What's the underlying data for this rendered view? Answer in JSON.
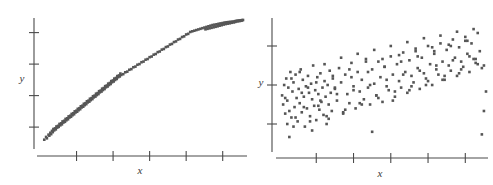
{
  "figure": {
    "name": "correlation-scatterplot-pair",
    "background_color": "#ffffff",
    "point_color": "#565656",
    "axis_color": "#4a4a4a"
  },
  "chart_data": [
    {
      "type": "scatter",
      "panel": "left",
      "title": "",
      "xlabel": "x",
      "ylabel": "y",
      "xlim": [
        0,
        100
      ],
      "ylim": [
        0,
        100
      ],
      "grid": false,
      "legend": null,
      "x_ticks": [
        18,
        36,
        54,
        72,
        90
      ],
      "y_ticks": [
        15,
        40,
        65,
        90
      ],
      "x_tick_labels": [
        "",
        "",
        "",
        "",
        ""
      ],
      "y_tick_labels": [
        "",
        "",
        "",
        ""
      ],
      "description": "Strong positive linear correlation, tight narrow band of points",
      "n_points": 185,
      "x": [
        2.1,
        3.0,
        3.4,
        4.2,
        4.6,
        5.1,
        5.5,
        5.9,
        6.3,
        6.6,
        7.0,
        7.4,
        7.8,
        8.1,
        8.5,
        8.9,
        9.2,
        9.6,
        10.0,
        10.4,
        10.8,
        11.1,
        11.5,
        11.9,
        12.3,
        12.6,
        13.0,
        13.4,
        13.8,
        14.1,
        14.5,
        14.9,
        15.3,
        15.6,
        16.0,
        16.4,
        16.8,
        17.1,
        17.5,
        17.9,
        18.3,
        18.6,
        19.0,
        19.4,
        19.8,
        20.1,
        20.5,
        20.9,
        21.3,
        21.6,
        22.0,
        22.4,
        22.8,
        23.1,
        23.5,
        23.9,
        24.3,
        24.6,
        25.0,
        25.4,
        25.8,
        26.1,
        26.5,
        26.9,
        27.3,
        27.6,
        28.0,
        28.4,
        28.8,
        29.1,
        29.5,
        29.9,
        30.3,
        30.6,
        31.0,
        31.4,
        31.8,
        32.1,
        32.5,
        32.9,
        33.3,
        33.6,
        34.0,
        34.4,
        34.8,
        35.1,
        35.5,
        35.9,
        36.3,
        36.6,
        37.0,
        37.4,
        37.8,
        38.1,
        38.5,
        38.9,
        39.3,
        39.6,
        40.0,
        41.0,
        42.0,
        43.0,
        44.0,
        45.0,
        46.0,
        47.0,
        48.0,
        49.0,
        50.0,
        51.0,
        52.0,
        53.0,
        54.0,
        55.0,
        56.0,
        57.0,
        58.0,
        59.0,
        60.0,
        61.0,
        62.0,
        63.0,
        64.0,
        65.0,
        66.0,
        67.0,
        68.0,
        69.0,
        70.0,
        71.0,
        72.0,
        73.0,
        74.0,
        75.0,
        76.0,
        77.0,
        78.0,
        79.0,
        80.0,
        81.0,
        82.0,
        83.0,
        84.0,
        85.0,
        86.0,
        87.0,
        88.0,
        89.0,
        90.0,
        91.0,
        92.0,
        93.0,
        94.0,
        95.0,
        96.0,
        96.5,
        97.0,
        97.5,
        98.0,
        98.5,
        99.0,
        99.3,
        99.6,
        100.0,
        93.5,
        94.5,
        95.5,
        96.2,
        97.2,
        98.2,
        99.1,
        91.5,
        92.5,
        89.5,
        90.5,
        87.5,
        88.5,
        85.5,
        86.5,
        83.5,
        84.5,
        81.5,
        82.5
      ],
      "y": [
        5.0,
        7.2,
        6.1,
        9.0,
        8.2,
        10.5,
        9.4,
        12.0,
        11.0,
        13.5,
        12.4,
        14.0,
        13.2,
        15.5,
        14.6,
        16.0,
        15.2,
        17.5,
        16.4,
        18.0,
        17.2,
        19.5,
        18.6,
        20.0,
        19.2,
        21.5,
        20.4,
        22.0,
        21.2,
        23.5,
        22.6,
        24.0,
        23.2,
        25.5,
        24.4,
        26.0,
        25.2,
        27.5,
        26.6,
        28.0,
        27.2,
        29.5,
        28.4,
        30.0,
        29.2,
        31.5,
        30.6,
        32.0,
        31.2,
        33.5,
        32.4,
        34.0,
        33.2,
        35.5,
        34.6,
        36.0,
        35.2,
        37.5,
        36.4,
        38.0,
        37.2,
        39.5,
        38.6,
        40.0,
        39.2,
        41.5,
        40.4,
        42.0,
        41.2,
        43.5,
        42.6,
        44.0,
        43.2,
        45.5,
        44.4,
        46.0,
        45.2,
        47.5,
        46.6,
        48.0,
        47.2,
        49.5,
        48.4,
        50.0,
        49.2,
        51.5,
        50.6,
        52.0,
        51.2,
        53.5,
        52.4,
        54.0,
        53.2,
        55.5,
        54.6,
        56.0,
        55.2,
        57.5,
        56.4,
        57.0,
        58.5,
        59.0,
        60.5,
        61.0,
        62.5,
        63.0,
        64.5,
        65.0,
        66.5,
        67.0,
        68.5,
        69.0,
        70.5,
        71.0,
        72.5,
        73.0,
        74.5,
        75.0,
        76.5,
        77.0,
        78.5,
        79.0,
        80.5,
        81.0,
        82.5,
        83.0,
        84.5,
        85.0,
        86.5,
        87.0,
        88.5,
        89.0,
        90.5,
        91.0,
        91.5,
        92.0,
        92.5,
        93.0,
        93.5,
        94.0,
        94.5,
        95.0,
        95.5,
        96.0,
        96.3,
        96.6,
        97.0,
        97.3,
        97.6,
        98.0,
        98.2,
        98.4,
        98.6,
        98.8,
        99.0,
        99.2,
        99.3,
        99.4,
        99.5,
        99.6,
        99.7,
        99.8,
        99.9,
        100.0,
        97.4,
        97.8,
        98.1,
        98.5,
        98.9,
        99.1,
        99.4,
        96.8,
        97.1,
        95.9,
        96.4,
        95.0,
        95.5,
        94.2,
        94.6,
        93.4,
        93.8,
        92.6,
        93.0
      ]
    },
    {
      "type": "scatter",
      "panel": "right",
      "title": "",
      "xlabel": "x",
      "ylabel": "y",
      "xlim": [
        0,
        100
      ],
      "ylim": [
        0,
        100
      ],
      "grid": false,
      "legend": null,
      "x_ticks": [
        18,
        36,
        54,
        72,
        90
      ],
      "y_ticks": [
        20,
        50,
        80
      ],
      "x_tick_labels": [
        "",
        "",
        "",
        "",
        ""
      ],
      "y_tick_labels": [
        "",
        "",
        ""
      ],
      "description": "Moderate positive correlation, widely scattered cloud of points",
      "n_points": 200,
      "x": [
        1.5,
        2.0,
        2.5,
        3.0,
        3.5,
        4.0,
        4.5,
        5.0,
        5.5,
        6.0,
        6.5,
        7.0,
        7.5,
        8.0,
        8.5,
        9.0,
        9.5,
        10.0,
        10.5,
        11.0,
        11.5,
        12.0,
        12.5,
        13.0,
        13.5,
        14.0,
        14.5,
        15.0,
        15.5,
        16.0,
        16.5,
        17.0,
        17.5,
        18.0,
        18.5,
        19.0,
        19.5,
        20.0,
        20.5,
        21.0,
        21.5,
        22.0,
        22.5,
        23.0,
        23.5,
        24.0,
        24.5,
        25.0,
        25.5,
        26.0,
        27.0,
        28.0,
        29.0,
        30.0,
        31.0,
        32.0,
        33.0,
        34.0,
        35.0,
        36.0,
        37.0,
        38.0,
        39.0,
        40.0,
        41.0,
        42.0,
        43.0,
        44.0,
        45.0,
        46.0,
        47.0,
        48.0,
        49.0,
        50.0,
        51.0,
        52.0,
        53.0,
        54.0,
        55.0,
        56.0,
        57.0,
        58.0,
        59.0,
        60.0,
        61.0,
        62.0,
        63.0,
        64.0,
        65.0,
        66.0,
        67.0,
        68.0,
        69.0,
        70.0,
        71.0,
        72.0,
        73.0,
        74.0,
        75.0,
        76.0,
        77.0,
        78.0,
        79.0,
        80.0,
        81.0,
        82.0,
        83.0,
        84.0,
        85.0,
        86.0,
        87.0,
        88.0,
        89.0,
        90.0,
        91.0,
        92.0,
        93.0,
        94.0,
        95.0,
        96.0,
        97.0,
        98.0,
        99.0,
        100.0,
        4.0,
        6.0,
        8.0,
        10.0,
        12.0,
        14.0,
        16.0,
        18.0,
        20.0,
        22.0,
        24.0,
        26.0,
        28.0,
        30.0,
        32.0,
        34.0,
        36.0,
        38.0,
        40.0,
        42.0,
        44.0,
        46.0,
        48.0,
        50.0,
        52.0,
        54.0,
        56.0,
        58.0,
        60.0,
        62.0,
        64.0,
        66.0,
        68.0,
        70.0,
        72.0,
        74.0,
        76.0,
        78.0,
        80.0,
        82.0,
        84.0,
        86.0,
        88.0,
        90.0,
        92.0,
        94.0,
        96.0,
        98.0,
        3.0,
        7.0,
        11.0,
        15.0,
        19.0,
        23.0,
        27.0,
        31.0,
        35.0,
        39.0,
        43.0,
        47.0,
        51.0,
        55.0,
        59.0,
        63.0,
        67.0,
        71.0,
        75.0,
        79.0,
        83.0,
        87.0,
        91.0,
        95.0,
        99.0,
        5.0,
        45.0,
        62.0
      ],
      "y": [
        42.0,
        35.0,
        50.0,
        28.0,
        55.0,
        38.0,
        48.0,
        30.0,
        60.0,
        25.0,
        45.0,
        52.0,
        33.0,
        58.0,
        40.0,
        22.0,
        47.0,
        36.0,
        62.0,
        29.0,
        54.0,
        41.0,
        18.0,
        49.0,
        32.0,
        57.0,
        44.0,
        26.0,
        51.0,
        39.0,
        65.0,
        34.0,
        46.0,
        23.0,
        56.0,
        43.0,
        31.0,
        59.0,
        37.0,
        48.0,
        27.0,
        53.0,
        41.0,
        20.0,
        50.0,
        35.0,
        61.0,
        44.0,
        30.0,
        55.0,
        47.0,
        38.0,
        63.0,
        52.0,
        29.0,
        58.0,
        43.0,
        36.0,
        67.0,
        49.0,
        32.0,
        60.0,
        45.0,
        54.0,
        39.0,
        70.0,
        48.0,
        35.0,
        62.0,
        51.0,
        42.0,
        68.0,
        56.0,
        37.0,
        64.0,
        49.0,
        46.0,
        72.0,
        58.0,
        41.0,
        66.0,
        53.0,
        48.0,
        75.0,
        60.0,
        44.0,
        69.0,
        57.0,
        52.0,
        78.0,
        63.0,
        47.0,
        71.0,
        59.0,
        55.0,
        80.0,
        66.0,
        50.0,
        74.0,
        62.0,
        58.0,
        82.0,
        68.0,
        54.0,
        77.0,
        65.0,
        61.0,
        85.0,
        71.0,
        57.0,
        79.0,
        68.0,
        64.0,
        87.0,
        74.0,
        60.0,
        82.0,
        70.0,
        67.0,
        90.0,
        76.0,
        63.0,
        30.0,
        45.0,
        20.0,
        55.0,
        25.0,
        60.0,
        33.0,
        48.0,
        15.0,
        52.0,
        38.0,
        66.0,
        24.0,
        57.0,
        43.0,
        71.0,
        31.0,
        62.0,
        46.0,
        74.0,
        35.0,
        68.0,
        50.0,
        77.0,
        40.0,
        70.0,
        54.0,
        80.0,
        45.0,
        73.0,
        58.0,
        83.0,
        49.0,
        76.0,
        61.0,
        86.0,
        53.0,
        79.0,
        65.0,
        88.0,
        57.0,
        81.0,
        69.0,
        91.0,
        62.0,
        84.0,
        72.0,
        93.0,
        66.0,
        12.0,
        40.0,
        18.0,
        44.0,
        22.0,
        34.0,
        26.0,
        48.0,
        28.0,
        56.0,
        36.0,
        60.0,
        42.0,
        64.0,
        38.0,
        68.0,
        46.0,
        72.0,
        50.0,
        76.0,
        54.0,
        80.0,
        59.0,
        84.0,
        70.0,
        65.0,
        10.0,
        14.0
      ]
    }
  ]
}
